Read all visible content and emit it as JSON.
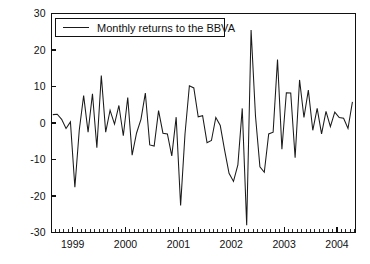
{
  "figure": {
    "title": "",
    "background_color": "#ffffff",
    "line_color": "#1a1a1a",
    "axis_color": "#111111"
  },
  "legend": {
    "label": "Monthly returns to the BBVA",
    "position": "top-left-inside",
    "swatch": "line-swatch"
  },
  "axes": {
    "y_ticks": [
      "30",
      "20",
      "10",
      "0",
      "-10",
      "-20",
      "-30"
    ],
    "x_ticks": [
      "1999",
      "2000",
      "2001",
      "2002",
      "2003",
      "2004"
    ],
    "y_axis_label": "",
    "x_axis_label": ""
  },
  "chart_data": {
    "type": "line",
    "title": "",
    "xlabel": "",
    "ylabel": "",
    "xlim": [
      1998.6,
      2004.35
    ],
    "ylim": [
      -30,
      30
    ],
    "grid": false,
    "legend_position": "upper left",
    "y_ticks": [
      30,
      20,
      10,
      0,
      -10,
      -20,
      -30
    ],
    "x_ticks": [
      1999,
      2000,
      2001,
      2002,
      2003,
      2004
    ],
    "x_minor_tick_interval": 0.0833,
    "series": [
      {
        "name": "Monthly returns to the BBVA",
        "color": "#1a1a1a",
        "x": [
          1998.625,
          1998.708,
          1998.792,
          1998.875,
          1998.958,
          1999.042,
          1999.125,
          1999.208,
          1999.292,
          1999.375,
          1999.458,
          1999.542,
          1999.625,
          1999.708,
          1999.792,
          1999.875,
          1999.958,
          2000.042,
          2000.125,
          2000.208,
          2000.292,
          2000.375,
          2000.458,
          2000.542,
          2000.625,
          2000.708,
          2000.792,
          2000.875,
          2000.958,
          2001.042,
          2001.125,
          2001.208,
          2001.292,
          2001.375,
          2001.458,
          2001.542,
          2001.625,
          2001.708,
          2001.792,
          2001.875,
          2001.958,
          2002.042,
          2002.125,
          2002.208,
          2002.292,
          2002.375,
          2002.458,
          2002.542,
          2002.625,
          2002.708,
          2002.792,
          2002.875,
          2002.958,
          2003.042,
          2003.125,
          2003.208,
          2003.292,
          2003.375,
          2003.458,
          2003.542,
          2003.625,
          2003.708,
          2003.792,
          2003.875,
          2003.958,
          2004.042,
          2004.125,
          2004.208,
          2004.292
        ],
        "values": [
          2.3,
          2.4,
          1.0,
          -1.5,
          0.3,
          -17.6,
          -2.0,
          7.5,
          -2.5,
          8.0,
          -6.8,
          13.0,
          -2.5,
          3.5,
          -0.3,
          4.8,
          -3.5,
          7.0,
          -8.8,
          -2.8,
          1.0,
          8.2,
          -6.0,
          -6.3,
          3.4,
          -2.8,
          -3.0,
          -9.0,
          1.6,
          -22.6,
          -3.0,
          10.2,
          9.6,
          1.7,
          2.0,
          -5.4,
          -4.8,
          1.5,
          -0.7,
          -7.5,
          -13.8,
          -16.0,
          -11.5,
          4.0,
          -28.0,
          25.5,
          2.0,
          -12.0,
          -13.5,
          -3.0,
          -2.5,
          17.4,
          -7.2,
          8.3,
          8.2,
          -9.5,
          11.8,
          1.5,
          9.0,
          -2.0,
          4.0,
          -3.0,
          3.2,
          -1.0,
          3.0,
          1.5,
          1.3,
          -1.5,
          5.8
        ]
      }
    ]
  }
}
